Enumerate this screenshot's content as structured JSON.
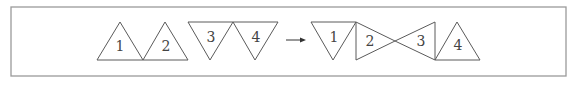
{
  "diagram": {
    "type": "triangle-rearrangement",
    "frame": {
      "x": 11,
      "y": 7,
      "width": 555,
      "height": 69,
      "stroke": "#9a9a9a"
    },
    "before": {
      "triangles": [
        {
          "label": "1",
          "orientation": "up",
          "points": "97,60 120,22 143,60",
          "label_pos": [
            120,
            46
          ]
        },
        {
          "label": "2",
          "orientation": "up",
          "points": "143,60 165,22 188,60",
          "label_pos": [
            166,
            46
          ]
        },
        {
          "label": "3",
          "orientation": "down",
          "points": "188,22 233,22 210,60",
          "label_pos": [
            211,
            37
          ]
        },
        {
          "label": "4",
          "orientation": "down",
          "points": "233,22 278,22 255,60",
          "label_pos": [
            256,
            37
          ]
        }
      ]
    },
    "arrow": {
      "x1": 286,
      "y1": 40,
      "x2": 306,
      "y2": 40,
      "direction": "right"
    },
    "after": {
      "triangles": [
        {
          "label": "1",
          "orientation": "down",
          "points": "311,22 356,22 333,60",
          "label_pos": [
            334,
            37
          ]
        },
        {
          "label": "2",
          "orientation": "right",
          "points": "356,22 356,60 395,41",
          "label_pos": [
            370,
            41
          ]
        },
        {
          "label": "3",
          "orientation": "left",
          "points": "395,41 435,22 435,60",
          "label_pos": [
            421,
            41
          ]
        },
        {
          "label": "4",
          "orientation": "up",
          "points": "435,60 457,22 480,60",
          "label_pos": [
            458,
            45
          ]
        }
      ]
    }
  }
}
